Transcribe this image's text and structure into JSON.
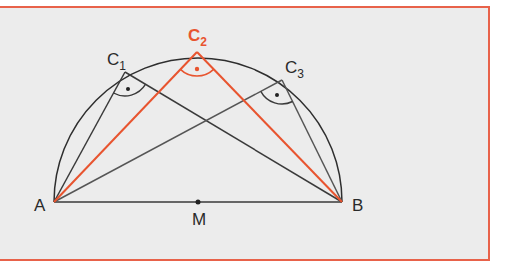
{
  "diagram": {
    "colors": {
      "frame": "#e8624a",
      "background": "#ececec",
      "line": "#3a3a3a",
      "accent": "#e8542f"
    },
    "points": {
      "A": {
        "label": "A",
        "x": 54,
        "y": 202
      },
      "B": {
        "label": "B",
        "x": 342,
        "y": 202
      },
      "M": {
        "label": "M",
        "x": 198,
        "y": 202
      },
      "C1": {
        "label": "C",
        "sub": "1",
        "x": 125,
        "y": 72
      },
      "C2": {
        "label": "C",
        "sub": "2",
        "x": 197,
        "y": 52
      },
      "C3": {
        "label": "C",
        "sub": "3",
        "x": 282,
        "y": 80
      }
    },
    "semicircle": {
      "center": "M",
      "radius": 144
    },
    "right_angle_marks": [
      "C1",
      "C2",
      "C3"
    ],
    "highlighted_triangle": "C2"
  }
}
